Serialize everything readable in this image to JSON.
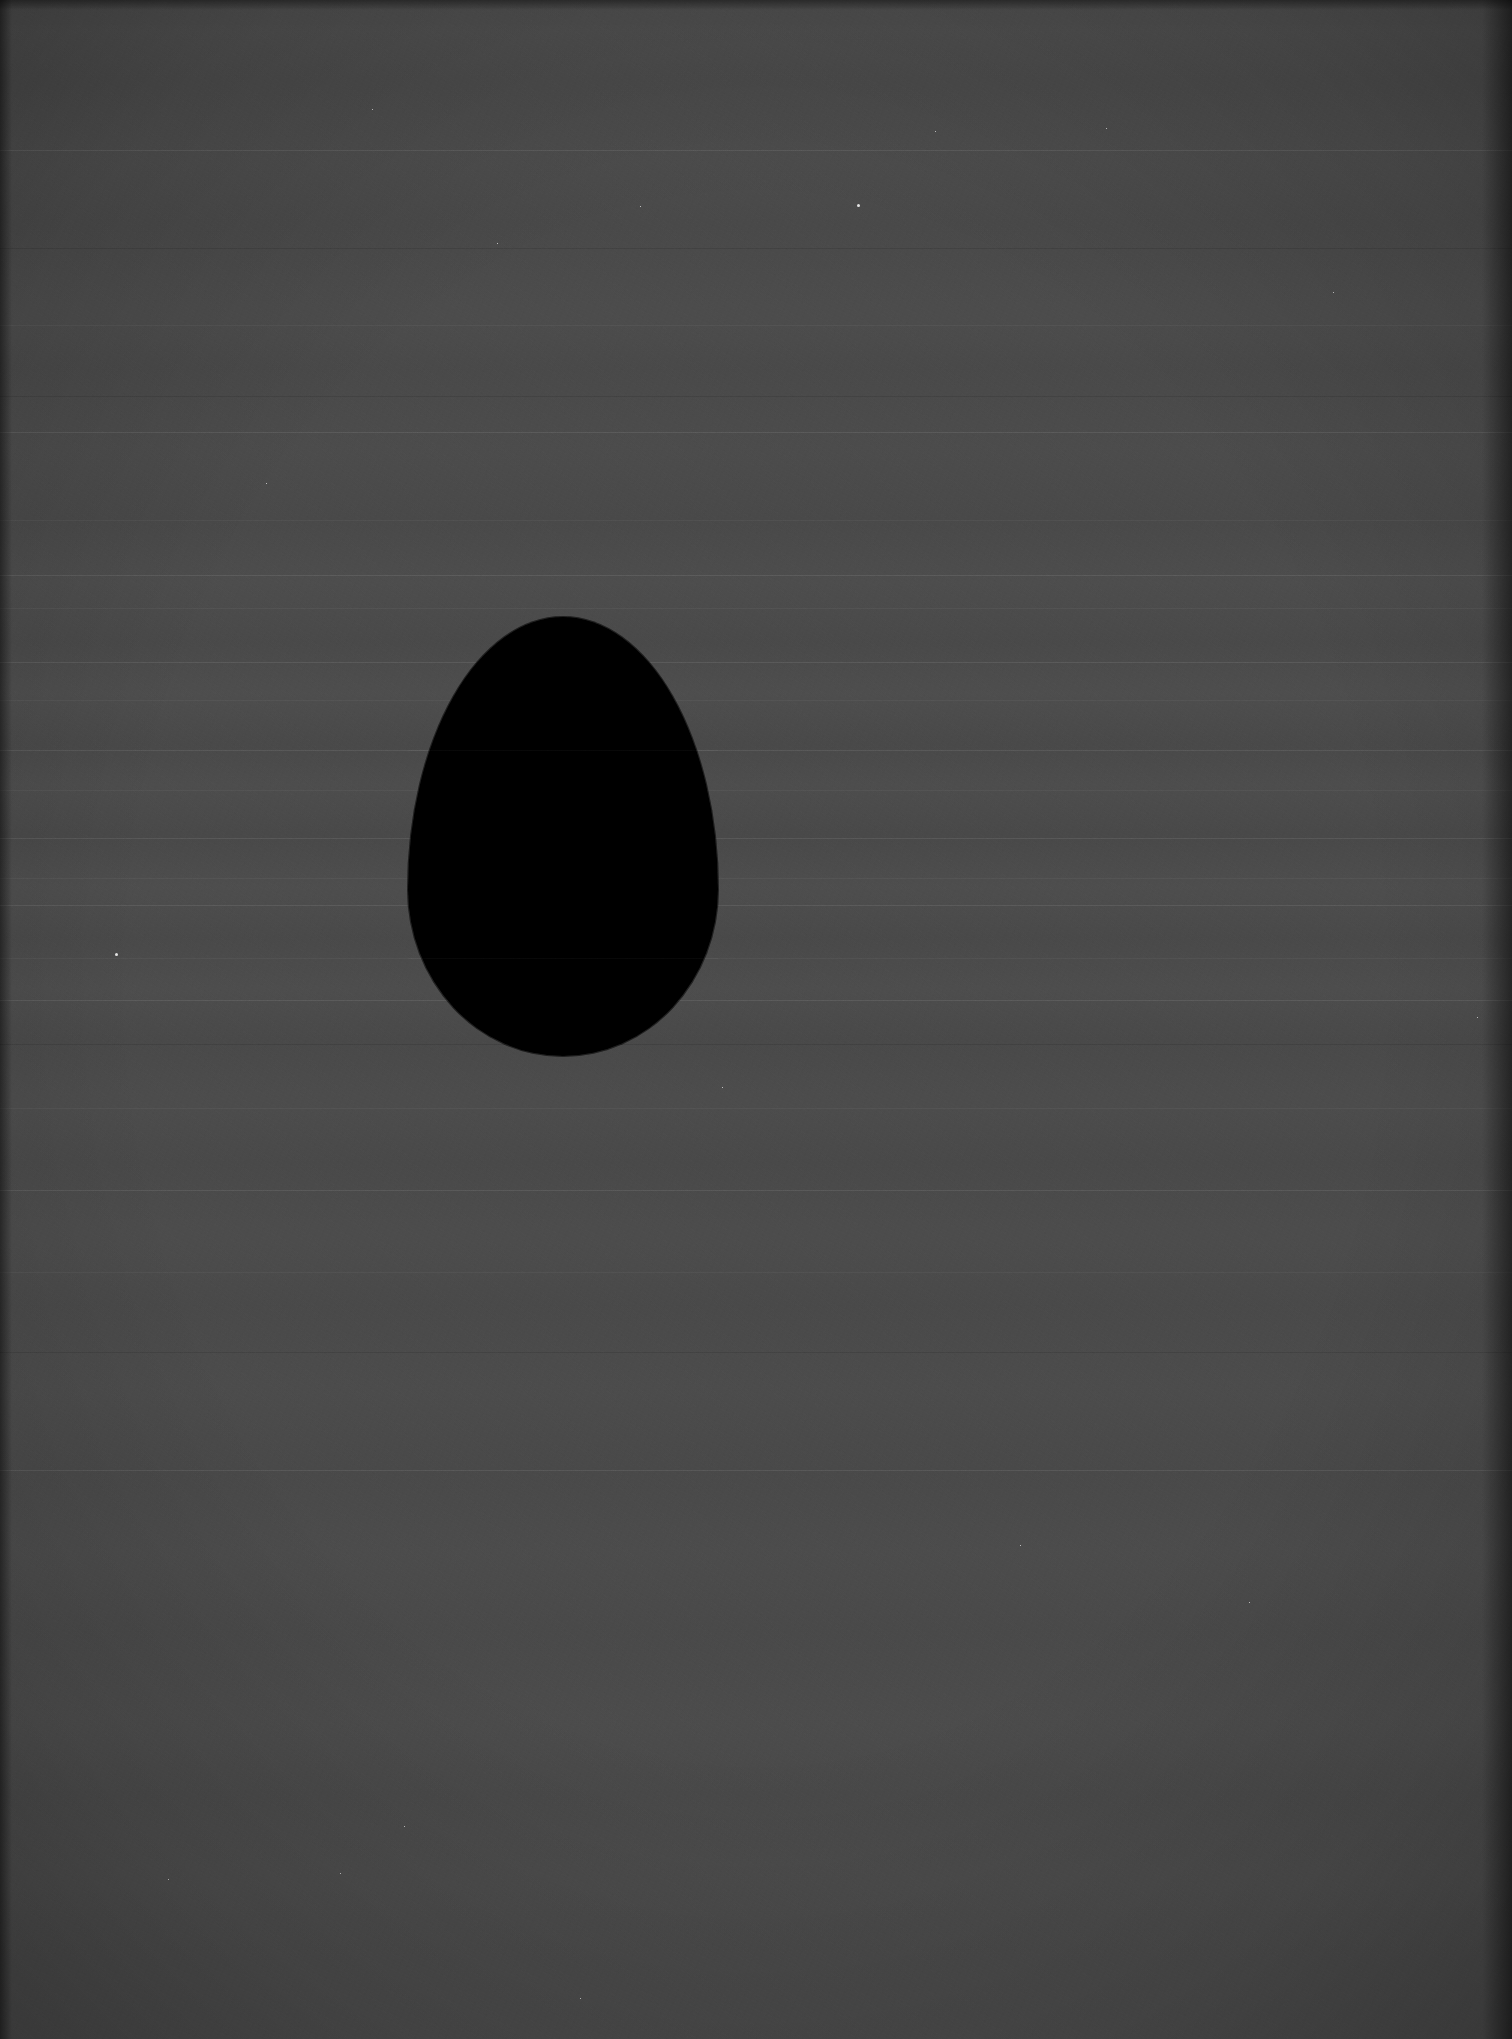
{
  "image": {
    "kind": "photograph",
    "subject": "egg-silhouette",
    "description": "A dark, featureless egg-shaped silhouette centered in a noisy mid-gray frame",
    "orientation": "portrait",
    "width_px": 1512,
    "height_px": 2039,
    "alt_text": "Black egg-shaped silhouette on a dark gray grainy background"
  },
  "palette": {
    "background": "#4a4a4a",
    "background_light_band": "#515151",
    "background_dark_band": "#434343",
    "subject": "#000000",
    "edge_shadow": "#1e1e1e",
    "speckle": "#e6e6e6"
  },
  "subject": {
    "name": "egg-silhouette",
    "shape": "egg",
    "fill": "#000000",
    "apex_x_px": 565,
    "apex_y_px": 617,
    "bottom_y_px": 1056,
    "left_x_px": 408,
    "right_x_px": 718,
    "width_px": 310,
    "height_px": 439,
    "center_x_px": 563,
    "center_y_px": 836
  },
  "artifacts": {
    "scan_lines_y_px": [
      150,
      325,
      432,
      520,
      575,
      608,
      662,
      700,
      750,
      790,
      838,
      878,
      905,
      958,
      1000,
      1108,
      1190,
      1272,
      1470
    ],
    "dark_lines_y_px": [
      248,
      396,
      1044,
      1352
    ],
    "egg_crossing_lines_y_px": [
      750,
      958
    ],
    "vignette": "radial",
    "left_edge_strip_px": 12,
    "right_edge_strip_px": 30,
    "top_edge_strip_px": 10,
    "grain": "fine sensor noise",
    "speckles": [
      {
        "x": 640,
        "y": 206,
        "size": "sm"
      },
      {
        "x": 857,
        "y": 204,
        "size": "lg"
      },
      {
        "x": 935,
        "y": 131,
        "size": "sm"
      },
      {
        "x": 497,
        "y": 243,
        "size": "sm"
      },
      {
        "x": 1106,
        "y": 128,
        "size": "sm"
      },
      {
        "x": 372,
        "y": 109,
        "size": "sm"
      },
      {
        "x": 115,
        "y": 953,
        "size": "lg"
      },
      {
        "x": 1333,
        "y": 292,
        "size": "sm"
      },
      {
        "x": 266,
        "y": 483,
        "size": "sm"
      },
      {
        "x": 722,
        "y": 1087,
        "size": "sm"
      },
      {
        "x": 1249,
        "y": 1602,
        "size": "sm"
      },
      {
        "x": 168,
        "y": 1879,
        "size": "sm"
      },
      {
        "x": 404,
        "y": 1826,
        "size": "sm"
      },
      {
        "x": 1020,
        "y": 1545,
        "size": "sm"
      },
      {
        "x": 340,
        "y": 1873,
        "size": "sm"
      },
      {
        "x": 580,
        "y": 1998,
        "size": "sm"
      },
      {
        "x": 1477,
        "y": 1017,
        "size": "sm"
      }
    ]
  }
}
